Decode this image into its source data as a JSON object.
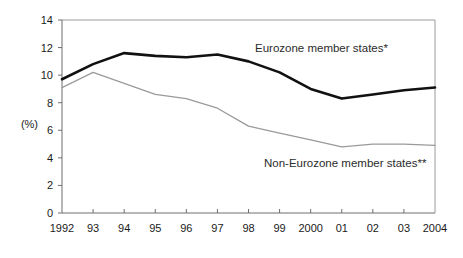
{
  "chart_data": {
    "type": "line",
    "title": "",
    "xlabel": "",
    "ylabel": "(%)",
    "ylim": [
      0,
      14
    ],
    "ytick_values": [
      0,
      2,
      4,
      6,
      8,
      10,
      12,
      14
    ],
    "ytick_labels": [
      "0",
      "2",
      "4",
      "6",
      "8",
      "10",
      "12",
      "14"
    ],
    "grid": false,
    "legend_position": "inline-annotation",
    "categories": [
      1992,
      1993,
      1994,
      1995,
      1996,
      1997,
      1998,
      1999,
      2000,
      2001,
      2002,
      2003,
      2004
    ],
    "xtick_labels": [
      "1992",
      "93",
      "94",
      "95",
      "96",
      "97",
      "98",
      "99",
      "2000",
      "01",
      "02",
      "03",
      "2004"
    ],
    "series": [
      {
        "name": "Eurozone member states*",
        "color": "#111111",
        "width": 2.6,
        "values": [
          9.7,
          10.8,
          11.6,
          11.4,
          11.3,
          11.5,
          11.0,
          10.2,
          9.0,
          8.3,
          8.6,
          8.9,
          9.1
        ]
      },
      {
        "name": "Non-Eurozone member states**",
        "color": "#9a9a9a",
        "width": 1.3,
        "values": [
          9.1,
          10.2,
          9.4,
          8.6,
          8.3,
          7.6,
          6.3,
          5.8,
          5.3,
          4.8,
          5.0,
          5.0,
          4.9
        ]
      }
    ],
    "annotations": [
      {
        "text": "Eurozone member states*",
        "x_px": 255,
        "y_px": 52
      },
      {
        "text": "Non-Eurozone member states**",
        "x_px": 264,
        "y_px": 167
      }
    ]
  },
  "axis": {
    "unit_label": "(%)"
  },
  "colors": {
    "eurozone": "#111111",
    "non_eurozone": "#9a9a9a",
    "frame": "#9a9a9a",
    "text": "#1a1a1a",
    "background": "#ffffff"
  }
}
